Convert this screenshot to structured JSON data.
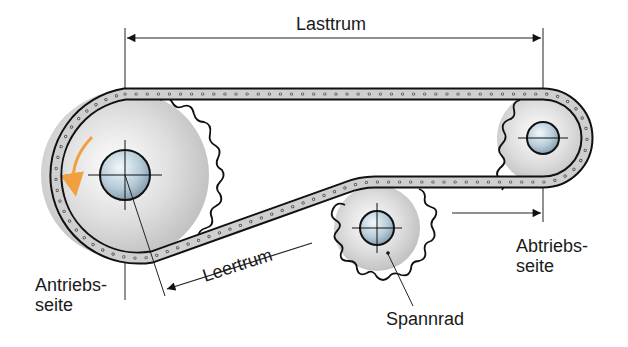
{
  "diagram": {
    "type": "chain-drive",
    "labels": {
      "top_span": "Lasttrum",
      "slack_span": "Leertrum",
      "drive_side_line1": "Antriebs-",
      "drive_side_line2": "seite",
      "driven_side_line1": "Abtriebs-",
      "driven_side_line2": "seite",
      "tensioner": "Spannrad"
    },
    "components": {
      "drive_sprocket": {
        "name": "Antriebsrad",
        "rotation": "counterclockwise"
      },
      "driven_sprocket": {
        "name": "Abtriebsrad"
      },
      "tensioner_sprocket": {
        "name": "Spannrad"
      },
      "chain": {
        "name": "Rollenkette"
      }
    },
    "colors": {
      "rotation_arrow": "#f0a040",
      "hub": "#b8ccd8",
      "sprocket_fill": "#d8d8d8",
      "outline": "#1a1a1a",
      "text": "#1a1a1a"
    }
  }
}
